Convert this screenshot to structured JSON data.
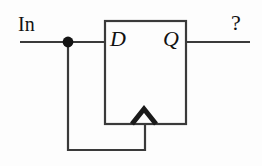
{
  "figure": {
    "kind": "logic-circuit-schematic",
    "background_color": "#fdfdfd",
    "line_color": "#3a3a3a",
    "text_color": "#111111"
  },
  "labels": {
    "input": "In",
    "data_pin": "D",
    "output_pin": "Q",
    "output_unknown": "?"
  },
  "component": {
    "name": "flip-flop-box",
    "type": "edge-triggered-flip-flop",
    "x": 105,
    "y": 21,
    "width": 81,
    "height": 103,
    "clock_marker": "rising-edge-chevron"
  },
  "wires": [
    {
      "name": "input-wire",
      "from": [
        20,
        42
      ],
      "to": [
        105,
        42
      ]
    },
    {
      "name": "output-wire",
      "from": [
        186,
        42
      ],
      "to": [
        250,
        42
      ]
    },
    {
      "name": "feedback-wire-vertical",
      "from": [
        68,
        42
      ],
      "to": [
        68,
        150
      ]
    },
    {
      "name": "feedback-wire-horizontal",
      "from": [
        68,
        150
      ],
      "to": [
        145,
        150
      ]
    },
    {
      "name": "clock-wire",
      "from": [
        145,
        150
      ],
      "to": [
        145,
        124
      ]
    }
  ],
  "junction": {
    "name": "wire-junction-dot",
    "x": 68,
    "y": 42,
    "radius": 5
  },
  "chevron": {
    "name": "clock-edge-chevron",
    "apex": [
      144,
      109
    ],
    "left": [
      132,
      124
    ],
    "right": [
      156,
      124
    ]
  },
  "underlines": [
    {
      "name": "in-label-underline",
      "from": [
        20,
        41
      ],
      "to": [
        68,
        41
      ]
    },
    {
      "name": "output-label-underline",
      "from": [
        186,
        41
      ],
      "to": [
        250,
        41
      ]
    }
  ]
}
